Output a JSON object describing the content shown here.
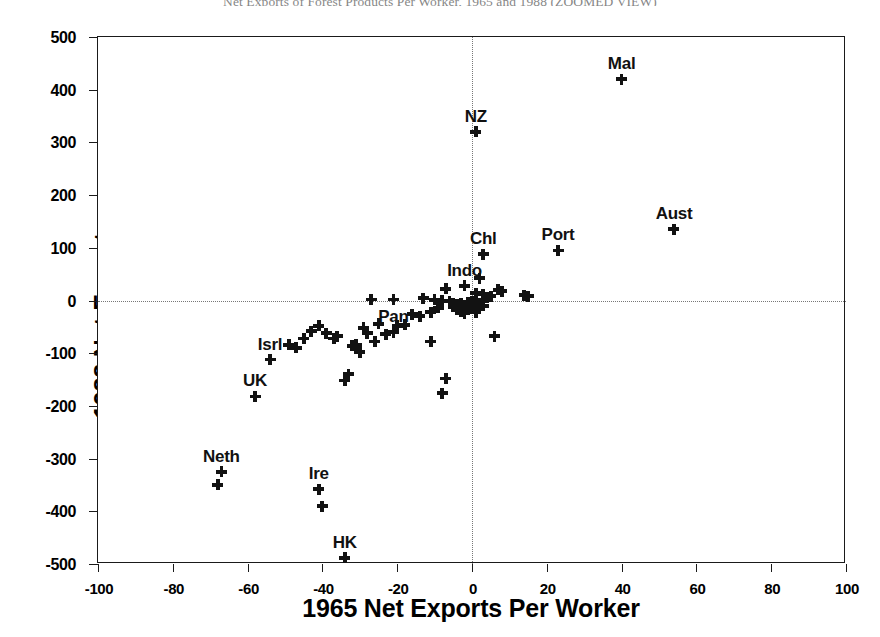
{
  "chart_data": {
    "type": "scatter",
    "title": "Net Exports of Forest Products Per Worker, 1965 and 1988 (ZOOMED VIEW)",
    "xlabel": "1965 Net Exports Per Worker",
    "ylabel": "1988 Net Exports",
    "xlim": [
      -100,
      100
    ],
    "ylim": [
      -500,
      500
    ],
    "xticks": [
      -100,
      -80,
      -60,
      -40,
      -20,
      0,
      20,
      40,
      60,
      80,
      100
    ],
    "yticks": [
      500,
      400,
      300,
      200,
      100,
      0,
      -100,
      -200,
      -300,
      -400,
      -500
    ],
    "xtick_labels": [
      "-100",
      "-80",
      "-60",
      "-40",
      "-20",
      "0",
      "20",
      "40",
      "60",
      "80",
      "100"
    ],
    "ytick_labels": [
      "500",
      "400",
      "300",
      "200",
      "100",
      "0",
      "-100",
      "-200",
      "-300",
      "-400",
      "-500"
    ],
    "grid": false,
    "reference_lines": [
      {
        "axis": "x",
        "value": 0,
        "style": "dotted"
      },
      {
        "axis": "y",
        "value": 0,
        "style": "dotted"
      }
    ],
    "legend": null,
    "marker": "plus",
    "marker_color": "#121212",
    "labeled_points": [
      {
        "label": "Mal",
        "x": 40,
        "y": 420,
        "label_dx": 0,
        "label_dy": -14
      },
      {
        "label": "NZ",
        "x": 1,
        "y": 320,
        "label_dx": 0,
        "label_dy": -14
      },
      {
        "label": "Aust",
        "x": 54,
        "y": 135,
        "label_dx": 0,
        "label_dy": -14
      },
      {
        "label": "Port",
        "x": 23,
        "y": 95,
        "label_dx": 0,
        "label_dy": -14
      },
      {
        "label": "Chl",
        "x": 3,
        "y": 88,
        "label_dx": 0,
        "label_dy": -14
      },
      {
        "label": "Indo",
        "x": -2,
        "y": 28,
        "label_dx": 0,
        "label_dy": -14
      },
      {
        "label": "Pan",
        "x": -21,
        "y": -60,
        "label_dx": 0,
        "label_dy": -14
      },
      {
        "label": "Isrl",
        "x": -54,
        "y": -112,
        "label_dx": 0,
        "label_dy": -14
      },
      {
        "label": "UK",
        "x": -58,
        "y": -182,
        "label_dx": 0,
        "label_dy": -14
      },
      {
        "label": "Neth",
        "x": -67,
        "y": -325,
        "label_dx": 0,
        "label_dy": -14
      },
      {
        "label": "Ire",
        "x": -41,
        "y": -358,
        "label_dx": 0,
        "label_dy": -14
      },
      {
        "label": "HK",
        "x": -34,
        "y": -488,
        "label_dx": 0,
        "label_dy": -14
      }
    ],
    "points": [
      {
        "x": 40,
        "y": 420
      },
      {
        "x": 1,
        "y": 320
      },
      {
        "x": 54,
        "y": 135
      },
      {
        "x": 23,
        "y": 95
      },
      {
        "x": 3,
        "y": 88
      },
      {
        "x": -2,
        "y": 28
      },
      {
        "x": 2,
        "y": 42
      },
      {
        "x": -7,
        "y": 22
      },
      {
        "x": 1,
        "y": 14
      },
      {
        "x": 3,
        "y": 12
      },
      {
        "x": 4,
        "y": 6
      },
      {
        "x": 5,
        "y": 8
      },
      {
        "x": 7,
        "y": 20
      },
      {
        "x": 8,
        "y": 18
      },
      {
        "x": 14,
        "y": 10
      },
      {
        "x": 15,
        "y": 8
      },
      {
        "x": -27,
        "y": 2
      },
      {
        "x": -21,
        "y": 2
      },
      {
        "x": -13,
        "y": 4
      },
      {
        "x": -10,
        "y": 1
      },
      {
        "x": -8,
        "y": 0
      },
      {
        "x": -6,
        "y": -2
      },
      {
        "x": -5,
        "y": -5
      },
      {
        "x": -5,
        "y": -12
      },
      {
        "x": -4,
        "y": -8
      },
      {
        "x": -4,
        "y": -18
      },
      {
        "x": -3,
        "y": -6
      },
      {
        "x": -3,
        "y": -20
      },
      {
        "x": -2,
        "y": -10
      },
      {
        "x": -2,
        "y": -24
      },
      {
        "x": -1,
        "y": -4
      },
      {
        "x": -1,
        "y": -16
      },
      {
        "x": 0,
        "y": -2
      },
      {
        "x": 0,
        "y": -14
      },
      {
        "x": 1,
        "y": -8
      },
      {
        "x": 1,
        "y": -22
      },
      {
        "x": 2,
        "y": -6
      },
      {
        "x": 2,
        "y": -16
      },
      {
        "x": 3,
        "y": -10
      },
      {
        "x": 3,
        "y": -2
      },
      {
        "x": -9,
        "y": -14
      },
      {
        "x": -11,
        "y": -22
      },
      {
        "x": -14,
        "y": -30
      },
      {
        "x": -16,
        "y": -26
      },
      {
        "x": -18,
        "y": -46
      },
      {
        "x": -20,
        "y": -48
      },
      {
        "x": -21,
        "y": -60
      },
      {
        "x": -23,
        "y": -64
      },
      {
        "x": -25,
        "y": -44
      },
      {
        "x": -26,
        "y": -78
      },
      {
        "x": -28,
        "y": -62
      },
      {
        "x": -29,
        "y": -52
      },
      {
        "x": -30,
        "y": -98
      },
      {
        "x": -31,
        "y": -84
      },
      {
        "x": -32,
        "y": -86
      },
      {
        "x": -33,
        "y": -140
      },
      {
        "x": -34,
        "y": -152
      },
      {
        "x": -36,
        "y": -68
      },
      {
        "x": -37,
        "y": -72
      },
      {
        "x": -39,
        "y": -62
      },
      {
        "x": -41,
        "y": -48
      },
      {
        "x": -43,
        "y": -58
      },
      {
        "x": -45,
        "y": -72
      },
      {
        "x": -47,
        "y": -90
      },
      {
        "x": -49,
        "y": -84
      },
      {
        "x": -54,
        "y": -112
      },
      {
        "x": -58,
        "y": -182
      },
      {
        "x": -11,
        "y": -78
      },
      {
        "x": -7,
        "y": -148
      },
      {
        "x": -8,
        "y": -176
      },
      {
        "x": 6,
        "y": -68
      },
      {
        "x": -67,
        "y": -325
      },
      {
        "x": -68,
        "y": -350
      },
      {
        "x": -41,
        "y": -358
      },
      {
        "x": -40,
        "y": -390
      },
      {
        "x": -34,
        "y": -488
      }
    ]
  }
}
